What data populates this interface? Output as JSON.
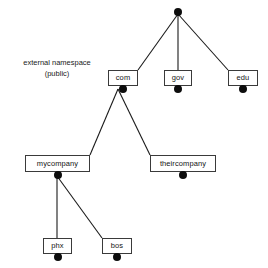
{
  "diagram": {
    "type": "tree",
    "background_color": "#ffffff",
    "line_color": "#1a1a1a",
    "box_border_color": "#3a3a3a",
    "box_fill_color": "#ffffff",
    "dot_color": "#0d0d0d",
    "text_color": "#141414"
  },
  "caption": {
    "line1": "external namespace",
    "line2": "(public)"
  },
  "nodes": [
    {
      "id": "root",
      "label": "",
      "level": 0,
      "has_box": false,
      "has_dot": true,
      "x": 178,
      "y": 12,
      "w": 0,
      "h": 0
    },
    {
      "id": "com",
      "label": "com",
      "level": 1,
      "has_box": true,
      "has_dot": true,
      "x": 108,
      "y": 70,
      "w": 30,
      "h": 16
    },
    {
      "id": "gov",
      "label": "gov",
      "level": 1,
      "has_box": true,
      "has_dot": true,
      "x": 164,
      "y": 70,
      "w": 28,
      "h": 16
    },
    {
      "id": "edu",
      "label": "edu",
      "level": 1,
      "has_box": true,
      "has_dot": true,
      "x": 228,
      "y": 70,
      "w": 30,
      "h": 16
    },
    {
      "id": "mycompany",
      "label": "mycompany",
      "level": 2,
      "has_box": true,
      "has_dot": true,
      "x": 25,
      "y": 155,
      "w": 65,
      "h": 17
    },
    {
      "id": "theircompany",
      "label": "theircompany",
      "level": 2,
      "has_box": true,
      "has_dot": true,
      "x": 150,
      "y": 155,
      "w": 66,
      "h": 17
    },
    {
      "id": "phx",
      "label": "phx",
      "level": 3,
      "has_box": true,
      "has_dot": true,
      "x": 43,
      "y": 238,
      "w": 29,
      "h": 16
    },
    {
      "id": "bos",
      "label": "bos",
      "level": 3,
      "has_box": true,
      "has_dot": true,
      "x": 102,
      "y": 238,
      "w": 30,
      "h": 16
    }
  ],
  "edges": [
    {
      "from": "root",
      "to": "com",
      "x1": 178,
      "y1": 14,
      "x2": 138,
      "y2": 70
    },
    {
      "from": "root",
      "to": "gov",
      "x1": 178,
      "y1": 14,
      "x2": 178,
      "y2": 70
    },
    {
      "from": "root",
      "to": "edu",
      "x1": 178,
      "y1": 14,
      "x2": 228,
      "y2": 70
    },
    {
      "from": "com",
      "to": "mycompany",
      "x1": 118,
      "y1": 89,
      "x2": 90,
      "y2": 155
    },
    {
      "from": "com",
      "to": "theircompany",
      "x1": 118,
      "y1": 89,
      "x2": 150,
      "y2": 155
    },
    {
      "from": "mycompany",
      "to": "phx",
      "x1": 57,
      "y1": 176,
      "x2": 57,
      "y2": 238
    },
    {
      "from": "mycompany",
      "to": "bos",
      "x1": 57,
      "y1": 176,
      "x2": 102,
      "y2": 238
    }
  ]
}
